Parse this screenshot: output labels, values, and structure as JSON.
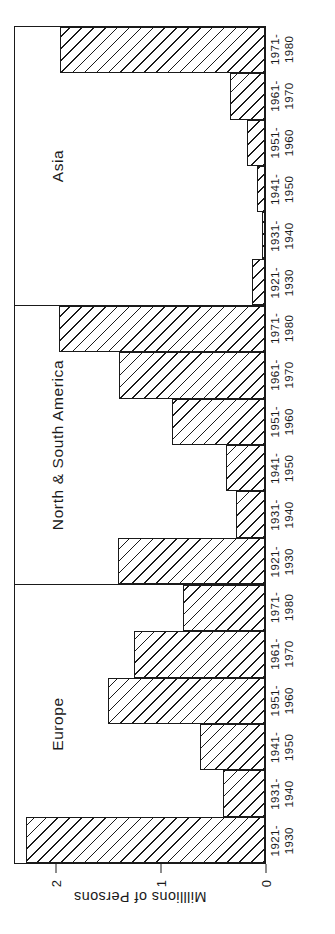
{
  "figure": {
    "ylabel": "Milllions of Persons",
    "y_ticks": [
      "0",
      "1",
      "2"
    ],
    "y_tick_values": [
      0,
      1,
      2
    ],
    "ylim": [
      0,
      2.4
    ],
    "categories_line1": [
      "1921-",
      "1931-",
      "1941-",
      "1951-",
      "1961-",
      "1971-"
    ],
    "categories_line2": [
      "1930",
      "1940",
      "1950",
      "1960",
      "1970",
      "1980"
    ]
  },
  "panels": [
    {
      "title": "Europe"
    },
    {
      "title": "North & South America"
    },
    {
      "title": "Asia"
    }
  ],
  "chart_data": {
    "type": "bar",
    "title": "",
    "xlabel": "",
    "ylabel": "Milllions of Persons",
    "ylim": [
      0,
      2.4
    ],
    "yticks": [
      0,
      1,
      2
    ],
    "grid": false,
    "legend": "none",
    "categories": [
      "1921-1930",
      "1931-1940",
      "1941-1950",
      "1951-1960",
      "1961-1970",
      "1971-1980"
    ],
    "panels": [
      {
        "name": "Europe",
        "values": [
          2.28,
          0.4,
          0.62,
          1.5,
          1.25,
          0.78
        ]
      },
      {
        "name": "North & South America",
        "values": [
          1.4,
          0.28,
          0.37,
          0.89,
          1.39,
          1.96
        ]
      },
      {
        "name": "Asia",
        "values": [
          0.12,
          0.03,
          0.08,
          0.17,
          0.33,
          1.95
        ]
      }
    ]
  }
}
